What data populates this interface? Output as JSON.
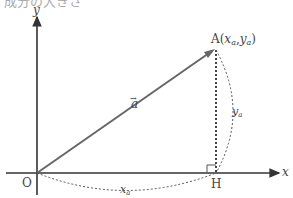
{
  "diagram": {
    "top_cut_text": "成分の大きさ",
    "axes": {
      "x_label": "x",
      "y_label": "y",
      "origin_label": "O"
    },
    "vector": {
      "label": "a",
      "arrow_mark": "→"
    },
    "point_a": {
      "name": "A",
      "coords_open": "(",
      "x": "x",
      "x_sub": "a",
      "sep": ",",
      "y": "y",
      "y_sub": "a",
      "coords_close": ")"
    },
    "point_h": {
      "name": "H"
    },
    "brace_x": {
      "main": "x",
      "sub": "a"
    },
    "brace_y": {
      "main": "y",
      "sub": "a"
    },
    "colors": {
      "axis": "#333333",
      "vector": "#666666",
      "dotted": "#444444"
    }
  }
}
